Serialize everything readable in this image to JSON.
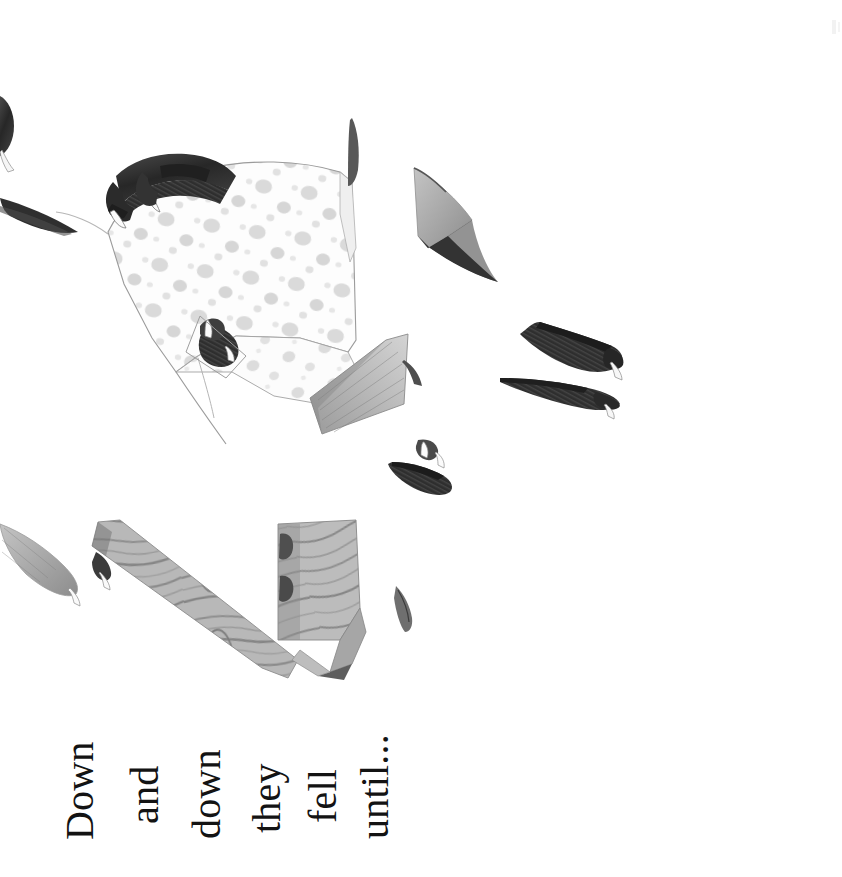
{
  "page": {
    "kind": "picture-book-page",
    "orientation": "rotated-90",
    "background_color": "#ffffff",
    "width": 842,
    "height": 877
  },
  "caption": {
    "full_text": "Down and down they fell until...",
    "text_color": "#131313",
    "words": [
      {
        "text": "Down",
        "left": 56,
        "top": 200
      },
      {
        "text": "and",
        "left": 121,
        "top": 184
      },
      {
        "text": "down",
        "left": 183,
        "top": 199
      },
      {
        "text": "they",
        "left": 243,
        "top": 193
      },
      {
        "text": "fell",
        "left": 299,
        "top": 183
      },
      {
        "text": "until...",
        "top": 199,
        "left": 351
      }
    ]
  },
  "artwork": {
    "description": "Shattered illustration fragments of a spotted garment gripped by dark claws, with wood-grain shards",
    "palette": {
      "paper": "#ffffff",
      "spot_fabric_light": "#fbfbfb",
      "spot_gray": "#d2d2d2",
      "spot_gray_dark": "#bdbdbd",
      "claw_dark": "#3a3a3a",
      "claw_black": "#232323",
      "wood_mid": "#b3b3b3",
      "wood_dark": "#8e8e8e",
      "shard_gray": "#a9a9a9",
      "outline": "#6f6f6f"
    },
    "fragments": [
      {
        "name": "spotted-garment",
        "role": "main-shape"
      },
      {
        "name": "claw-top-left",
        "role": "dark-claw"
      },
      {
        "name": "claw-inner",
        "role": "dark-claw"
      },
      {
        "name": "claw-right-upper",
        "role": "dark-claw"
      },
      {
        "name": "claw-right-lower",
        "role": "dark-claw"
      },
      {
        "name": "claw-center-small",
        "role": "dark-claw"
      },
      {
        "name": "claw-far-left-top",
        "role": "dark-claw"
      },
      {
        "name": "shard-upper-right",
        "role": "gray-shard"
      },
      {
        "name": "shard-center",
        "role": "gray-shard"
      },
      {
        "name": "sliver-top-center",
        "role": "thin-sliver"
      },
      {
        "name": "sliver-left",
        "role": "thin-sliver"
      },
      {
        "name": "wood-plank-diagonal",
        "role": "wood-shard"
      },
      {
        "name": "wood-block",
        "role": "wood-shard"
      },
      {
        "name": "wood-tail",
        "role": "wood-shard"
      },
      {
        "name": "feather-left-lower",
        "role": "gray-shard"
      },
      {
        "name": "nib-bottom-right",
        "role": "thin-sliver"
      }
    ]
  }
}
